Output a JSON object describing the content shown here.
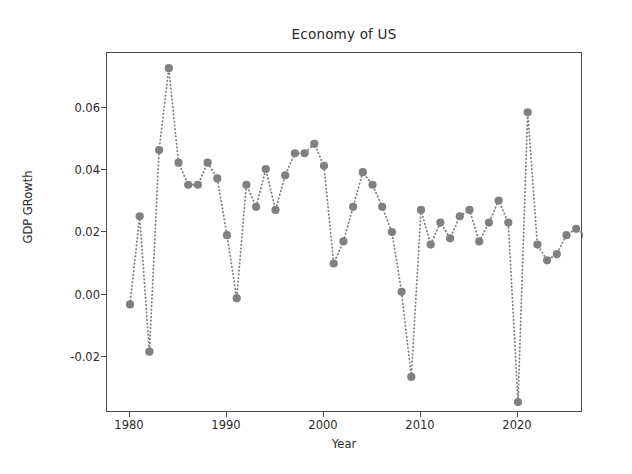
{
  "chart_data": {
    "type": "line",
    "title": "Economy of US",
    "xlabel": "Year",
    "ylabel": "GDP GRowth",
    "grid": false,
    "legend": null,
    "marker": "circle",
    "linestyle": "dotted",
    "color": "#808080",
    "xlim": [
      1978.6,
      1928.0
    ],
    "xlim_actual": [
      1978.6,
      2028.4
    ],
    "ylim": [
      -0.0405,
      0.0805
    ],
    "xticks": [
      1980,
      1990,
      2000,
      2010,
      2020
    ],
    "xtick_labels": [
      "1980",
      "1990",
      "2000",
      "2010",
      "2020"
    ],
    "yticks": [
      -0.02,
      0.0,
      0.02,
      0.04,
      0.06
    ],
    "ytick_labels": [
      "-0.02",
      "0.00",
      "0.02",
      "0.04",
      "0.06"
    ],
    "x": [
      1980,
      1981,
      1982,
      1983,
      1984,
      1985,
      1986,
      1987,
      1988,
      1989,
      1990,
      1991,
      1992,
      1993,
      1994,
      1995,
      1996,
      1997,
      1998,
      1999,
      2000,
      2001,
      2002,
      2003,
      2004,
      2005,
      2006,
      2007,
      2008,
      2009,
      2010,
      2011,
      2012,
      2013,
      2014,
      2015,
      2016,
      2017,
      2018,
      2019,
      2020,
      2021,
      2022,
      2023,
      2024,
      2025,
      2026,
      2027
    ],
    "values": [
      -0.003,
      0.025,
      -0.018,
      0.046,
      0.072,
      0.042,
      0.035,
      0.035,
      0.042,
      0.037,
      0.019,
      -0.001,
      0.035,
      0.028,
      0.04,
      0.027,
      0.038,
      0.045,
      0.045,
      0.048,
      0.041,
      0.01,
      0.017,
      0.028,
      0.039,
      0.035,
      0.028,
      0.02,
      0.001,
      -0.026,
      0.027,
      0.016,
      0.023,
      0.018,
      0.025,
      0.027,
      0.017,
      0.023,
      0.03,
      0.023,
      -0.034,
      0.058,
      0.016,
      0.011,
      0.013,
      0.019,
      0.021,
      0.019
    ],
    "ylabel_unit": "fraction",
    "n_points": 48
  }
}
